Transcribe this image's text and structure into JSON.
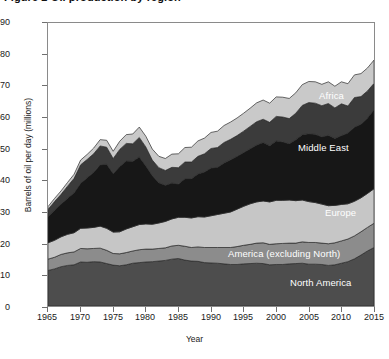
{
  "figure": {
    "title": "Figure 2 Oil production by region",
    "ylabel": "Barrels of oil per day (millions)",
    "xlabel": "Year"
  },
  "axes": {
    "y_ticks": [
      "90",
      "80",
      "70",
      "60",
      "50",
      "40",
      "30",
      "20",
      "10",
      "0"
    ],
    "x_ticks": [
      "1965",
      "1970",
      "1975",
      "1980",
      "1985",
      "1990",
      "1995",
      "2000",
      "2005",
      "2010",
      "2015"
    ]
  },
  "series_labels": {
    "asia": "Asia",
    "africa": "Africa",
    "middle_east": "Middle East",
    "europe": "Europe",
    "america_ex_north": "America (excluding North)",
    "north_america": "North America"
  },
  "colors": {
    "north_america": "#4d4d4d",
    "america_ex_north": "#8c8c8c",
    "europe": "#c6c6c6",
    "middle_east": "#171717",
    "africa": "#3b3b3b",
    "asia": "#c9c9c9",
    "frame": "#8a8a8a",
    "label_text": "#ffffff"
  },
  "chart_data": {
    "type": "area",
    "stacked": true,
    "title": "Figure 2 Oil production by region",
    "xlabel": "Year",
    "ylabel": "Barrels of oil per day (millions)",
    "xlim": [
      1965,
      2015
    ],
    "ylim": [
      0,
      90
    ],
    "grid": false,
    "legend": "in-plot labels",
    "x": [
      1965,
      1966,
      1967,
      1968,
      1969,
      1970,
      1971,
      1972,
      1973,
      1974,
      1975,
      1976,
      1977,
      1978,
      1979,
      1980,
      1981,
      1982,
      1983,
      1984,
      1985,
      1986,
      1987,
      1988,
      1989,
      1990,
      1991,
      1992,
      1993,
      1994,
      1995,
      1996,
      1997,
      1998,
      1999,
      2000,
      2001,
      2002,
      2003,
      2004,
      2005,
      2006,
      2007,
      2008,
      2009,
      2010,
      2011,
      2012,
      2013,
      2014,
      2015
    ],
    "series": [
      {
        "name": "North America",
        "values": [
          11.3,
          11.8,
          12.5,
          12.9,
          13.1,
          14.0,
          13.9,
          14.1,
          14.0,
          13.5,
          13.0,
          12.8,
          13.1,
          13.6,
          13.8,
          14.0,
          14.1,
          14.3,
          14.5,
          14.9,
          15.1,
          14.6,
          14.3,
          14.2,
          13.8,
          13.7,
          13.6,
          13.4,
          13.2,
          13.2,
          13.4,
          13.5,
          13.6,
          13.5,
          13.1,
          13.2,
          13.2,
          13.4,
          13.5,
          13.6,
          13.3,
          13.3,
          13.2,
          12.9,
          13.1,
          13.6,
          14.1,
          15.0,
          16.2,
          17.5,
          18.6
        ]
      },
      {
        "name": "America (excluding North)",
        "values": [
          3.6,
          3.7,
          3.9,
          4.0,
          4.1,
          4.3,
          4.3,
          4.2,
          4.4,
          4.2,
          3.7,
          3.8,
          3.9,
          3.9,
          4.1,
          4.1,
          4.0,
          4.0,
          4.0,
          4.2,
          4.2,
          4.4,
          4.3,
          4.6,
          4.8,
          4.9,
          5.0,
          5.2,
          5.4,
          5.7,
          5.9,
          6.1,
          6.4,
          6.6,
          6.5,
          6.6,
          6.7,
          6.6,
          6.5,
          6.8,
          6.9,
          6.9,
          6.8,
          6.9,
          7.0,
          7.1,
          7.2,
          7.3,
          7.4,
          7.5,
          7.7
        ]
      },
      {
        "name": "Europe",
        "values": [
          5.2,
          5.4,
          5.6,
          5.9,
          6.1,
          6.4,
          6.6,
          6.7,
          7.0,
          7.0,
          6.8,
          7.0,
          7.5,
          7.7,
          8.0,
          8.0,
          7.9,
          8.1,
          8.4,
          8.6,
          8.9,
          9.2,
          9.4,
          9.6,
          9.7,
          10.1,
          10.5,
          10.9,
          11.3,
          11.9,
          12.4,
          12.9,
          13.1,
          13.3,
          13.5,
          13.8,
          13.7,
          13.7,
          13.5,
          13.3,
          13.0,
          12.7,
          12.4,
          12.1,
          11.9,
          11.6,
          11.2,
          11.0,
          10.8,
          10.8,
          11.0
        ]
      },
      {
        "name": "Middle East",
        "values": [
          8.4,
          9.5,
          10.4,
          11.5,
          12.7,
          14.3,
          16.0,
          17.5,
          19.5,
          20.4,
          18.6,
          20.8,
          21.6,
          20.8,
          21.5,
          18.5,
          15.5,
          12.8,
          11.5,
          11.4,
          10.6,
          12.3,
          12.5,
          13.6,
          14.3,
          15.2,
          15.0,
          16.0,
          16.6,
          16.8,
          17.1,
          17.5,
          18.1,
          18.6,
          17.9,
          18.9,
          18.6,
          17.9,
          19.4,
          20.8,
          21.6,
          21.7,
          21.4,
          22.4,
          21.3,
          21.9,
          22.5,
          23.6,
          23.4,
          24.0,
          25.1
        ]
      },
      {
        "name": "Africa",
        "values": [
          2.2,
          2.8,
          3.1,
          3.8,
          4.6,
          5.9,
          5.8,
          5.9,
          6.0,
          5.4,
          4.8,
          5.4,
          5.6,
          5.6,
          6.2,
          6.0,
          4.9,
          4.8,
          4.7,
          5.0,
          5.2,
          5.3,
          5.3,
          5.6,
          5.8,
          6.2,
          6.3,
          6.5,
          6.5,
          6.6,
          6.8,
          7.1,
          7.4,
          7.4,
          7.4,
          7.8,
          7.9,
          8.0,
          8.4,
          9.3,
          9.9,
          9.9,
          9.9,
          10.1,
          9.7,
          10.1,
          8.6,
          9.4,
          8.8,
          8.6,
          8.4
        ]
      },
      {
        "name": "Asia",
        "values": [
          0.9,
          1.0,
          1.1,
          1.2,
          1.3,
          1.5,
          1.6,
          1.8,
          2.0,
          2.2,
          2.3,
          2.6,
          2.8,
          3.1,
          3.3,
          3.4,
          3.5,
          3.6,
          3.8,
          4.2,
          4.4,
          4.6,
          4.7,
          4.9,
          5.0,
          5.1,
          5.2,
          5.4,
          5.5,
          5.6,
          5.7,
          5.8,
          6.0,
          6.1,
          6.1,
          6.2,
          6.3,
          6.4,
          6.5,
          6.6,
          6.7,
          6.8,
          6.8,
          6.9,
          6.9,
          7.0,
          7.1,
          7.2,
          7.3,
          7.3,
          7.4
        ]
      }
    ]
  }
}
